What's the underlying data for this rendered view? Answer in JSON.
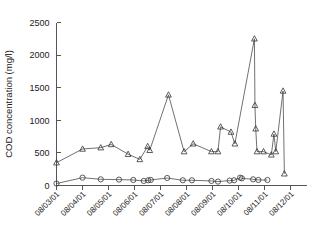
{
  "chart_data": {
    "type": "line",
    "title": "",
    "xlabel": "",
    "ylabel": "COD concentration (mg/l)",
    "ylim": [
      0,
      2500
    ],
    "yticks": [
      0,
      500,
      1000,
      1500,
      2000,
      2500
    ],
    "ytick_labels": [
      "0",
      "500",
      "1000",
      "1500",
      "2000",
      "2500"
    ],
    "xtick_labels": [
      "08/03/01",
      "08/04/01",
      "08/05/01",
      "08/06/01",
      "08/07/01",
      "08/08/01",
      "08/09/01",
      "08/10/01",
      "08/11/01",
      "08/12/01"
    ],
    "xlim": [
      0,
      9.6
    ],
    "grid": false,
    "legend": "none",
    "series": [
      {
        "name": "influent-cod",
        "marker": "triangle",
        "points": [
          [
            0.0,
            350
          ],
          [
            1.0,
            560
          ],
          [
            1.7,
            580
          ],
          [
            2.1,
            630
          ],
          [
            2.75,
            480
          ],
          [
            3.2,
            400
          ],
          [
            3.5,
            600
          ],
          [
            3.58,
            540
          ],
          [
            4.3,
            1390
          ],
          [
            4.9,
            520
          ],
          [
            5.25,
            640
          ],
          [
            5.95,
            520
          ],
          [
            6.2,
            520
          ],
          [
            6.3,
            900
          ],
          [
            6.7,
            820
          ],
          [
            6.85,
            640
          ],
          [
            7.6,
            2250
          ],
          [
            7.62,
            1230
          ],
          [
            7.65,
            870
          ],
          [
            7.7,
            520
          ],
          [
            7.95,
            520
          ],
          [
            8.25,
            470
          ],
          [
            8.35,
            790
          ],
          [
            8.42,
            520
          ],
          [
            8.7,
            1450
          ],
          [
            8.75,
            180
          ]
        ]
      },
      {
        "name": "effluent-cod",
        "marker": "circle",
        "points": [
          [
            0.0,
            30
          ],
          [
            1.0,
            120
          ],
          [
            1.7,
            95
          ],
          [
            2.4,
            90
          ],
          [
            2.95,
            85
          ],
          [
            3.35,
            70
          ],
          [
            3.52,
            80
          ],
          [
            3.62,
            85
          ],
          [
            4.25,
            115
          ],
          [
            4.85,
            80
          ],
          [
            5.2,
            80
          ],
          [
            5.95,
            70
          ],
          [
            6.2,
            60
          ],
          [
            6.65,
            75
          ],
          [
            6.82,
            80
          ],
          [
            7.05,
            120
          ],
          [
            7.12,
            110
          ],
          [
            7.55,
            95
          ],
          [
            7.75,
            85
          ],
          [
            8.1,
            85
          ]
        ]
      }
    ]
  }
}
